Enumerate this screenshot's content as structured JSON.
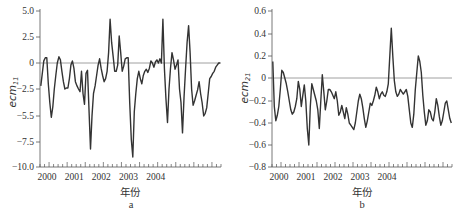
{
  "chart_data": [
    {
      "type": "line",
      "panel": "a",
      "title": "",
      "xlabel": "年份",
      "ylabel": "ecm11",
      "ylabel_main": "ecm",
      "ylabel_sub": "11",
      "ylim": [
        -10.0,
        5.0
      ],
      "yticks": [
        "5.0",
        "2.5",
        "0",
        "-2.5",
        "-5.5",
        "-7.5",
        "-10.0"
      ],
      "xticks": [
        "2000",
        "2001",
        "2002",
        "2003",
        "2004"
      ],
      "reference_line": 0,
      "x": [
        0,
        1,
        2,
        3,
        4,
        5,
        6,
        7,
        8,
        9,
        10,
        11,
        12,
        13,
        14,
        15,
        16,
        17,
        18,
        19,
        20,
        21,
        22,
        23,
        24,
        25,
        26,
        27,
        28,
        29,
        30,
        31,
        32,
        33,
        34,
        35,
        36,
        37,
        38,
        39,
        40,
        41,
        42,
        43,
        44,
        45,
        46,
        47,
        48,
        49,
        50,
        51,
        52,
        53,
        54,
        55,
        56,
        57,
        58,
        59,
        60,
        61,
        62,
        63,
        64,
        65,
        66,
        67,
        68,
        69,
        70,
        71,
        72,
        73,
        74,
        75,
        76,
        77,
        78,
        79,
        80,
        81,
        82,
        83,
        84,
        85,
        86,
        87,
        88,
        89,
        90,
        91,
        92,
        93,
        94,
        95,
        96,
        97,
        98,
        99,
        100,
        101,
        102,
        103,
        104,
        105,
        106,
        107,
        108,
        109,
        110,
        111,
        112,
        113,
        114,
        115,
        116,
        117,
        118,
        119
      ],
      "values": [
        -2.2,
        -1.0,
        0.2,
        0.5,
        0.5,
        -2.0,
        -4.0,
        -5.6,
        -4.5,
        -2.5,
        -1.2,
        0.0,
        0.6,
        0.3,
        -0.8,
        -1.8,
        -2.5,
        -2.4,
        -2.4,
        -1.5,
        -0.2,
        0.2,
        -0.5,
        -1.8,
        -2.2,
        -2.5,
        -2.8,
        -0.8,
        -3.0,
        -4.2,
        -1.0,
        -0.7,
        -4.8,
        -8.2,
        -5.5,
        -3.0,
        -2.2,
        -1.2,
        -0.2,
        0.4,
        -0.5,
        -1.2,
        -1.8,
        -1.5,
        -0.8,
        1.0,
        4.2,
        2.0,
        0.6,
        -0.8,
        -0.8,
        -0.2,
        2.6,
        1.0,
        -0.8,
        -0.3,
        0.4,
        0.5,
        0.5,
        -4.0,
        -7.3,
        -9.0,
        -5.0,
        -3.0,
        -1.5,
        -0.8,
        -1.5,
        -2.0,
        -1.2,
        -0.8,
        -0.6,
        -0.9,
        -0.5,
        0.2,
        0.0,
        -0.4,
        0.1,
        0.3,
        0.0,
        0.4,
        0.0,
        4.2,
        -0.5,
        -3.5,
        -6.0,
        -2.5,
        -0.5,
        1.0,
        0.3,
        -0.6,
        -0.2,
        0.3,
        -2.5,
        -4.0,
        -6.8,
        -3.5,
        -0.5,
        2.0,
        3.6,
        1.0,
        -2.5,
        -4.3,
        -3.8,
        -3.2,
        -2.6,
        -1.8,
        -3.0,
        -4.0,
        -5.5,
        -5.2,
        -4.6,
        -3.0,
        -1.5,
        -1.3,
        -1.0,
        -0.8,
        -0.4,
        -0.2,
        0.0,
        0.0
      ]
    },
    {
      "type": "line",
      "panel": "b",
      "title": "",
      "xlabel": "年份",
      "ylabel": "ecm21",
      "ylabel_main": "ecm",
      "ylabel_sub": "21",
      "ylim": [
        -0.8,
        0.6
      ],
      "yticks": [
        "0.6",
        "0.4",
        "0.2",
        "0",
        "-0.2",
        "-0.4",
        "-0.6",
        "-0.8"
      ],
      "xticks": [
        "2000",
        "2001",
        "2002",
        "2003",
        "2004"
      ],
      "reference_line": 0,
      "x": [
        0,
        1,
        2,
        3,
        4,
        5,
        6,
        7,
        8,
        9,
        10,
        11,
        12,
        13,
        14,
        15,
        16,
        17,
        18,
        19,
        20,
        21,
        22,
        23,
        24,
        25,
        26,
        27,
        28,
        29,
        30,
        31,
        32,
        33,
        34,
        35,
        36,
        37,
        38,
        39,
        40,
        41,
        42,
        43,
        44,
        45,
        46,
        47,
        48,
        49,
        50,
        51,
        52,
        53,
        54,
        55,
        56,
        57,
        58,
        59,
        60,
        61,
        62,
        63,
        64,
        65,
        66,
        67,
        68,
        69,
        70,
        71,
        72,
        73,
        74,
        75,
        76,
        77,
        78,
        79,
        80,
        81,
        82,
        83,
        84,
        85,
        86,
        87,
        88,
        89,
        90,
        91,
        92,
        93,
        94,
        95,
        96,
        97,
        98,
        99,
        100,
        101,
        102,
        103,
        104,
        105,
        106,
        107,
        108,
        109,
        110,
        111,
        112,
        113,
        114,
        115,
        116,
        117,
        118,
        119
      ],
      "values": [
        0.15,
        -0.25,
        -0.38,
        -0.33,
        -0.25,
        -0.1,
        0.07,
        0.05,
        0.0,
        -0.05,
        -0.12,
        -0.2,
        -0.28,
        -0.32,
        -0.3,
        -0.25,
        -0.18,
        -0.03,
        -0.1,
        -0.25,
        -0.15,
        -0.06,
        -0.2,
        -0.45,
        -0.6,
        -0.25,
        -0.05,
        -0.1,
        -0.15,
        -0.2,
        -0.28,
        -0.45,
        -0.2,
        0.03,
        -0.12,
        -0.28,
        -0.2,
        -0.1,
        -0.1,
        -0.12,
        -0.15,
        -0.18,
        -0.12,
        -0.2,
        -0.33,
        -0.3,
        -0.24,
        -0.3,
        -0.36,
        -0.26,
        -0.32,
        -0.4,
        -0.42,
        -0.44,
        -0.46,
        -0.4,
        -0.3,
        -0.2,
        -0.14,
        -0.18,
        -0.26,
        -0.36,
        -0.44,
        -0.38,
        -0.3,
        -0.22,
        -0.24,
        -0.2,
        -0.15,
        -0.08,
        -0.12,
        -0.18,
        -0.14,
        -0.12,
        -0.15,
        -0.16,
        -0.12,
        -0.05,
        0.2,
        0.45,
        0.2,
        -0.02,
        -0.12,
        -0.16,
        -0.14,
        -0.1,
        -0.12,
        -0.14,
        -0.12,
        -0.1,
        -0.16,
        -0.28,
        -0.4,
        -0.44,
        -0.32,
        -0.1,
        0.05,
        0.2,
        0.15,
        0.05,
        -0.15,
        -0.3,
        -0.42,
        -0.38,
        -0.28,
        -0.3,
        -0.36,
        -0.38,
        -0.3,
        -0.18,
        -0.24,
        -0.34,
        -0.42,
        -0.38,
        -0.3,
        -0.22,
        -0.2,
        -0.28,
        -0.36,
        -0.4
      ]
    }
  ]
}
